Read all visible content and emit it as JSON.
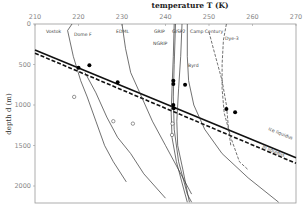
{
  "chart_data": {
    "type": "line",
    "title": "temperature T (K)",
    "xlabel": "temperature T (K)",
    "ylabel": "depth d (m)",
    "xlim": [
      210,
      270
    ],
    "ylim": [
      2200,
      0
    ],
    "x_axis_position": "top",
    "x_ticks": [
      "210",
      "220",
      "230",
      "240",
      "250",
      "260",
      "270"
    ],
    "y_ticks": [
      "0",
      "500",
      "1000",
      "1500",
      "2000"
    ],
    "grid": false,
    "series": [
      {
        "name": "Vostok",
        "style": "solid",
        "points": [
          [
            218.5,
            0
          ],
          [
            217.5,
            80
          ],
          [
            218.8,
            400
          ],
          [
            220.5,
            700
          ],
          [
            222,
            900
          ],
          [
            224,
            1200
          ],
          [
            226,
            1500
          ],
          [
            228,
            1700
          ],
          [
            231,
            1950
          ]
        ]
      },
      {
        "name": "Dome F",
        "style": "solid",
        "points": [
          [
            221.5,
            600
          ],
          [
            224,
            850
          ],
          [
            226.5,
            1150
          ],
          [
            229,
            1400
          ],
          [
            232,
            1600
          ],
          [
            235,
            1850
          ],
          [
            240,
            2150
          ]
        ]
      },
      {
        "name": "EDML",
        "style": "solid",
        "points": [
          [
            230,
            0
          ],
          [
            230.8,
            300
          ],
          [
            232,
            600
          ],
          [
            234.5,
            900
          ],
          [
            237,
            1200
          ],
          [
            240,
            1500
          ],
          [
            243,
            1800
          ],
          [
            246,
            2100
          ]
        ]
      },
      {
        "name": "GRIP",
        "style": "solid",
        "points": [
          [
            242,
            0
          ],
          [
            241.8,
            400
          ],
          [
            241.5,
            800
          ],
          [
            241.3,
            1100
          ],
          [
            241.5,
            1400
          ],
          [
            242.5,
            1700
          ],
          [
            244,
            2000
          ],
          [
            245,
            2200
          ]
        ]
      },
      {
        "name": "NGRIP",
        "style": "solid",
        "points": [
          [
            242.3,
            0
          ],
          [
            242,
            500
          ],
          [
            241.8,
            900
          ],
          [
            242,
            1300
          ],
          [
            243,
            1700
          ],
          [
            245,
            2100
          ],
          [
            246,
            2200
          ]
        ]
      },
      {
        "name": "GISP2",
        "style": "solid",
        "points": [
          [
            243.8,
            0
          ],
          [
            243.5,
            400
          ],
          [
            243,
            800
          ],
          [
            242.6,
            1200
          ],
          [
            242.8,
            1500
          ],
          [
            244,
            1800
          ],
          [
            245.5,
            2200
          ]
        ]
      },
      {
        "name": "Byrd",
        "style": "solid",
        "points": [
          [
            245,
            0
          ],
          [
            245,
            400
          ],
          [
            245.3,
            700
          ],
          [
            246.5,
            1000
          ],
          [
            249,
            1300
          ],
          [
            253,
            1600
          ],
          [
            259,
            1900
          ],
          [
            266,
            2200
          ]
        ]
      },
      {
        "name": "Camp Century",
        "style": "dashed",
        "points": [
          [
            250,
            100
          ],
          [
            251,
            300
          ],
          [
            252,
            500
          ],
          [
            253,
            700
          ],
          [
            254,
            1000
          ],
          [
            254.5,
            1300
          ],
          [
            255,
            1500
          ]
        ]
      },
      {
        "name": "Dye-3",
        "style": "dashed",
        "points": [
          [
            254,
            0
          ],
          [
            253.3,
            200
          ],
          [
            253,
            500
          ],
          [
            253,
            800
          ],
          [
            253.5,
            1100
          ],
          [
            255,
            1400
          ],
          [
            257,
            1700
          ],
          [
            259,
            1800
          ]
        ]
      }
    ],
    "reference_lines": [
      {
        "name": "ice liquidus",
        "label": "ice liquidus",
        "style": "solid-thick",
        "points": [
          [
            210,
            320
          ],
          [
            270,
            1650
          ]
        ]
      },
      {
        "name": "Ih liquidus",
        "label": "Ih liquidus",
        "style": "dashed-thick",
        "points": [
          [
            210,
            360
          ],
          [
            270,
            1720
          ]
        ]
      }
    ],
    "markers": {
      "filled": [
        [
          220,
          540
        ],
        [
          222.5,
          510
        ],
        [
          229,
          720
        ],
        [
          241.8,
          700
        ],
        [
          241.8,
          740
        ],
        [
          241.8,
          1000
        ],
        [
          241.9,
          1040
        ],
        [
          244.5,
          750
        ],
        [
          254,
          1050
        ],
        [
          256,
          1090
        ]
      ],
      "open": [
        [
          219,
          900
        ],
        [
          228,
          1200
        ],
        [
          232.5,
          1230
        ],
        [
          241.6,
          1230
        ],
        [
          241.5,
          1370
        ]
      ]
    }
  }
}
